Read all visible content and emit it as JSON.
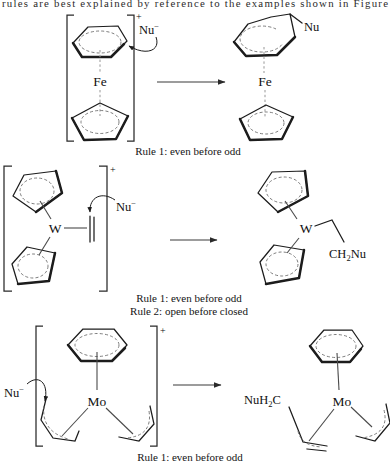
{
  "page": {
    "background": "#ffffff",
    "ink": "#1c1c1c",
    "muted_gray": "#979797"
  },
  "header": {
    "clipped_line": "rules are best explained by reference to the examples shown in Figure"
  },
  "schemes": [
    {
      "metal": "Fe",
      "charge": "+",
      "nucleophile": "Nu",
      "nucleophile_charge": "−",
      "product_substituent": "Nu",
      "captions": [
        "Rule 1: even before odd"
      ]
    },
    {
      "metal": "W",
      "charge": "+",
      "nucleophile": "Nu",
      "nucleophile_charge": "−",
      "product_substituent_pre": "CH",
      "product_substituent_sub": "2",
      "product_substituent_post": "Nu",
      "captions": [
        "Rule 1: even before odd",
        "Rule 2: open before closed"
      ]
    },
    {
      "metal": "Mo",
      "charge": "+",
      "nucleophile": "Nu",
      "nucleophile_charge": "−",
      "product_substituent_pre": "NuH",
      "product_substituent_sub": "2",
      "product_substituent_post": "C",
      "captions": [
        "Rule 1: even before odd"
      ]
    }
  ]
}
